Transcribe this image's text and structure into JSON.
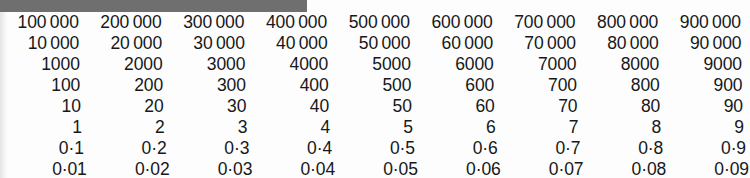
{
  "page": {
    "kind": "place-value-number-chart",
    "decimal_separator": "·",
    "thousands_separator": " ",
    "text_color": "#16181a",
    "background_color": "#fdfdfd"
  },
  "top_bar": {
    "color": "#6f6f6f",
    "width_px": 307,
    "height_px": 12
  },
  "left_edge_band": {
    "color": "#e4e4e4"
  },
  "grid": {
    "row_count": 8,
    "column_count": 9,
    "alignment": "right",
    "rows": [
      [
        "100 000",
        "200 000",
        "300 000",
        "400 000",
        "500 000",
        "600 000",
        "700 000",
        "800 000",
        "900 000"
      ],
      [
        "10 000",
        "20 000",
        "30 000",
        "40 000",
        "50 000",
        "60 000",
        "70 000",
        "80 000",
        "90 000"
      ],
      [
        "1000",
        "2000",
        "3000",
        "4000",
        "5000",
        "6000",
        "7000",
        "8000",
        "9000"
      ],
      [
        "100",
        "200",
        "300",
        "400",
        "500",
        "600",
        "700",
        "800",
        "900"
      ],
      [
        "10",
        "20",
        "30",
        "40",
        "50",
        "60",
        "70",
        "80",
        "90"
      ],
      [
        "1",
        "2",
        "3",
        "4",
        "5",
        "6",
        "7",
        "8",
        "9"
      ],
      [
        "0·1",
        "0·2",
        "0·3",
        "0·4",
        "0·5",
        "0·6",
        "0·7",
        "0·8",
        "0·9"
      ],
      [
        "0·01",
        "0·02",
        "0·03",
        "0·04",
        "0·05",
        "0·06",
        "0·07",
        "0·08",
        "0·09"
      ]
    ]
  }
}
